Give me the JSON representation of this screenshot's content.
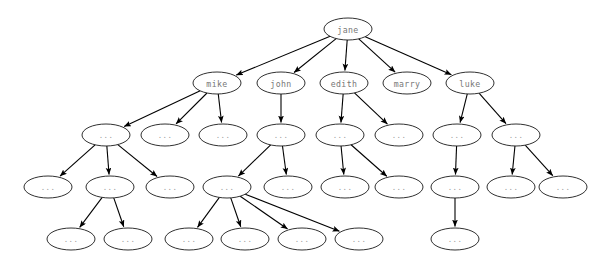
{
  "diagram": {
    "type": "directed-tree",
    "title": "",
    "root": "jane",
    "placeholder_label": "...",
    "colors": {
      "background": "#ffffff",
      "node_fill": "#ffffff",
      "node_stroke": "#1a1a1a",
      "edge_stroke": "#000000",
      "label_text": "#777777",
      "placeholder_text": "#9a9a9a"
    },
    "node_size": {
      "rx": 24,
      "ry": 11
    },
    "levels": [
      {
        "index": 0,
        "y": 29,
        "nodes": [
          {
            "id": "n0_0",
            "label": "jane",
            "x": 348,
            "named": true
          }
        ]
      },
      {
        "index": 1,
        "y": 83,
        "nodes": [
          {
            "id": "n1_0",
            "label": "mike",
            "x": 217,
            "named": true
          },
          {
            "id": "n1_1",
            "label": "john",
            "x": 281,
            "named": true
          },
          {
            "id": "n1_2",
            "label": "edith",
            "x": 344,
            "named": true
          },
          {
            "id": "n1_3",
            "label": "marry",
            "x": 407,
            "named": true
          },
          {
            "id": "n1_4",
            "label": "luke",
            "x": 470,
            "named": true
          }
        ]
      },
      {
        "index": 2,
        "y": 135,
        "nodes": [
          {
            "id": "n2_0",
            "label": "...",
            "x": 106,
            "named": false
          },
          {
            "id": "n2_1",
            "label": "...",
            "x": 165,
            "named": false
          },
          {
            "id": "n2_2",
            "label": "...",
            "x": 223,
            "named": false
          },
          {
            "id": "n2_3",
            "label": "...",
            "x": 281,
            "named": false
          },
          {
            "id": "n2_4",
            "label": "...",
            "x": 340,
            "named": false
          },
          {
            "id": "n2_5",
            "label": "...",
            "x": 399,
            "named": false
          },
          {
            "id": "n2_6",
            "label": "...",
            "x": 457,
            "named": false
          },
          {
            "id": "n2_7",
            "label": "...",
            "x": 516,
            "named": false
          }
        ]
      },
      {
        "index": 3,
        "y": 187,
        "nodes": [
          {
            "id": "n3_0",
            "label": "...",
            "x": 48,
            "named": false
          },
          {
            "id": "n3_1",
            "label": "...",
            "x": 110,
            "named": false
          },
          {
            "id": "n3_2",
            "label": "...",
            "x": 170,
            "named": false
          },
          {
            "id": "n3_3",
            "label": "...",
            "x": 227,
            "named": false
          },
          {
            "id": "n3_4",
            "label": "...",
            "x": 288,
            "named": false
          },
          {
            "id": "n3_5",
            "label": "...",
            "x": 345,
            "named": false
          },
          {
            "id": "n3_6",
            "label": "...",
            "x": 399,
            "named": false
          },
          {
            "id": "n3_7",
            "label": "...",
            "x": 455,
            "named": false
          },
          {
            "id": "n3_8",
            "label": "...",
            "x": 511,
            "named": false
          },
          {
            "id": "n3_9",
            "label": "...",
            "x": 563,
            "named": false
          }
        ]
      },
      {
        "index": 4,
        "y": 239,
        "nodes": [
          {
            "id": "n4_0",
            "label": "...",
            "x": 71,
            "named": false
          },
          {
            "id": "n4_1",
            "label": "...",
            "x": 128,
            "named": false
          },
          {
            "id": "n4_2",
            "label": "...",
            "x": 189,
            "named": false
          },
          {
            "id": "n4_3",
            "label": "...",
            "x": 245,
            "named": false
          },
          {
            "id": "n4_4",
            "label": "...",
            "x": 302,
            "named": false
          },
          {
            "id": "n4_5",
            "label": "...",
            "x": 359,
            "named": false
          },
          {
            "id": "n4_6",
            "label": "...",
            "x": 455,
            "named": false
          }
        ]
      }
    ],
    "edges": [
      {
        "from": "n0_0",
        "to": "n1_0"
      },
      {
        "from": "n0_0",
        "to": "n1_1"
      },
      {
        "from": "n0_0",
        "to": "n1_2"
      },
      {
        "from": "n0_0",
        "to": "n1_3"
      },
      {
        "from": "n0_0",
        "to": "n1_4"
      },
      {
        "from": "n1_0",
        "to": "n2_0"
      },
      {
        "from": "n1_0",
        "to": "n2_1"
      },
      {
        "from": "n1_0",
        "to": "n2_2"
      },
      {
        "from": "n1_1",
        "to": "n2_3"
      },
      {
        "from": "n1_2",
        "to": "n2_4"
      },
      {
        "from": "n1_2",
        "to": "n2_5"
      },
      {
        "from": "n1_4",
        "to": "n2_6"
      },
      {
        "from": "n1_4",
        "to": "n2_7"
      },
      {
        "from": "n2_0",
        "to": "n3_0"
      },
      {
        "from": "n2_0",
        "to": "n3_1"
      },
      {
        "from": "n2_0",
        "to": "n3_2"
      },
      {
        "from": "n2_3",
        "to": "n3_3"
      },
      {
        "from": "n2_3",
        "to": "n3_4"
      },
      {
        "from": "n2_4",
        "to": "n3_5"
      },
      {
        "from": "n2_4",
        "to": "n3_6"
      },
      {
        "from": "n2_6",
        "to": "n3_7"
      },
      {
        "from": "n2_7",
        "to": "n3_8"
      },
      {
        "from": "n2_7",
        "to": "n3_9"
      },
      {
        "from": "n3_1",
        "to": "n4_0"
      },
      {
        "from": "n3_1",
        "to": "n4_1"
      },
      {
        "from": "n3_3",
        "to": "n4_2"
      },
      {
        "from": "n3_3",
        "to": "n4_3"
      },
      {
        "from": "n3_3",
        "to": "n4_4"
      },
      {
        "from": "n3_3",
        "to": "n4_5"
      },
      {
        "from": "n3_7",
        "to": "n4_6"
      }
    ]
  }
}
